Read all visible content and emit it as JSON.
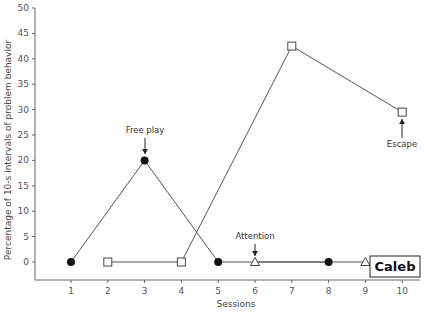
{
  "chart_data": {
    "type": "line",
    "title": "",
    "xlabel": "Sessions",
    "ylabel": "Percentage of 10-s intervals of problem behavior",
    "xlim": [
      0,
      10.5
    ],
    "ylim": [
      -3,
      50
    ],
    "x_ticks": [
      1,
      2,
      3,
      4,
      5,
      6,
      7,
      8,
      9,
      10
    ],
    "y_ticks": [
      0,
      5,
      10,
      15,
      20,
      25,
      30,
      35,
      40,
      45,
      50
    ],
    "grid": false,
    "series": [
      {
        "name": "Free play",
        "marker": "filled-circle",
        "x": [
          1,
          3,
          5,
          8
        ],
        "values": [
          0,
          20,
          0,
          0
        ]
      },
      {
        "name": "Escape",
        "marker": "open-square",
        "x": [
          2,
          4,
          7,
          10
        ],
        "values": [
          0,
          0,
          42.5,
          29.5
        ]
      },
      {
        "name": "Attention",
        "marker": "open-triangle",
        "x": [
          6,
          9
        ],
        "values": [
          0,
          0
        ]
      }
    ],
    "annotations": [
      {
        "text": "Free play",
        "x": 3,
        "y": 20,
        "arrow": "down"
      },
      {
        "text": "Attention",
        "x": 6,
        "y": 0,
        "arrow": "down"
      },
      {
        "text": "Escape",
        "x": 10,
        "y": 29.5,
        "arrow": "up"
      }
    ],
    "panel_label": "Caleb"
  },
  "labels": {
    "xlabel": "Sessions",
    "ylabel": "Percentage of 10-s intervals of problem behavior",
    "annot_free_play": "Free play",
    "annot_attention": "Attention",
    "annot_escape": "Escape",
    "panel_label": "Caleb"
  },
  "colors": {
    "line": "#555555",
    "marker_fill": "#111111",
    "axis": "#666666"
  }
}
